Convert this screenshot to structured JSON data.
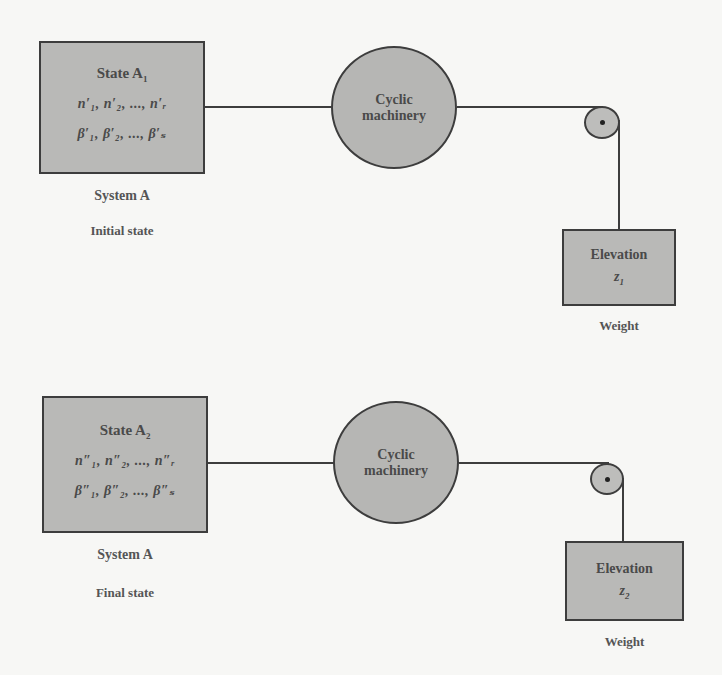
{
  "figure": {
    "panels": [
      {
        "id": "initial",
        "state_box": {
          "title": "State A",
          "title_sub": "1",
          "row_n": "n′₁, n′₂, ..., n′ᵣ",
          "row_beta": "β′₁, β′₂, ..., β′ₛ"
        },
        "system_label": "System A",
        "state_label": "Initial state",
        "machinery_label": "Cyclic\nmachinery",
        "weight": {
          "title": "Elevation",
          "variable": "z",
          "variable_sub": "1",
          "caption": "Weight"
        }
      },
      {
        "id": "final",
        "state_box": {
          "title": "State A",
          "title_sub": "2",
          "row_n": "n″₁, n″₂, ..., n″ᵣ",
          "row_beta": "β″₁, β″₂, ..., β″ₛ"
        },
        "system_label": "System A",
        "state_label": "Final state",
        "machinery_label": "Cyclic\nmachinery",
        "weight": {
          "title": "Elevation",
          "variable": "z",
          "variable_sub": "2",
          "caption": "Weight"
        }
      }
    ],
    "colors": {
      "fill": "#b9b9b7",
      "stroke": "#3d3d3d",
      "background": "#f7f7f5"
    }
  }
}
